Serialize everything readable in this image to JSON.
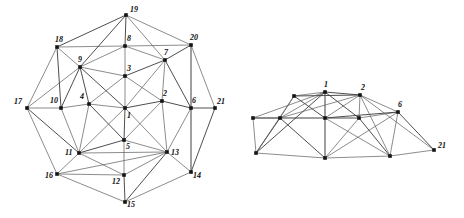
{
  "figure": {
    "type": "graph-diagram",
    "panels": [
      {
        "id": "left",
        "name": "star-embedding",
        "vertex_count": 21,
        "vertices": [
          {
            "id": "1",
            "x": 125,
            "y": 108,
            "label_dx": 2,
            "label_dy": 4
          },
          {
            "id": "2",
            "x": 162,
            "y": 101,
            "label_dx": 1,
            "label_dy": -11
          },
          {
            "id": "3",
            "x": 125,
            "y": 76,
            "label_dx": 2,
            "label_dy": -11
          },
          {
            "id": "4",
            "x": 89,
            "y": 104,
            "label_dx": -9,
            "label_dy": -11
          },
          {
            "id": "5",
            "x": 124,
            "y": 140,
            "label_dx": 2,
            "label_dy": 3
          },
          {
            "id": "6",
            "x": 191,
            "y": 108,
            "label_dx": 1,
            "label_dy": -11
          },
          {
            "id": "7",
            "x": 165,
            "y": 60,
            "label_dx": -1,
            "label_dy": -11
          },
          {
            "id": "8",
            "x": 125,
            "y": 46,
            "label_dx": 2,
            "label_dy": -11
          },
          {
            "id": "9",
            "x": 80,
            "y": 67,
            "label_dx": -2,
            "label_dy": -11
          },
          {
            "id": "10",
            "x": 61,
            "y": 108,
            "label_dx": -11,
            "label_dy": -11
          },
          {
            "id": "11",
            "x": 79,
            "y": 153,
            "label_dx": -14,
            "label_dy": -4
          },
          {
            "id": "12",
            "x": 124,
            "y": 175,
            "label_dx": -12,
            "label_dy": 3
          },
          {
            "id": "13",
            "x": 167,
            "y": 152,
            "label_dx": 4,
            "label_dy": -3
          },
          {
            "id": "14",
            "x": 191,
            "y": 172,
            "label_dx": 2,
            "label_dy": 0
          },
          {
            "id": "15",
            "x": 125,
            "y": 202,
            "label_dx": 2,
            "label_dy": -1
          },
          {
            "id": "16",
            "x": 57,
            "y": 174,
            "label_dx": -12,
            "label_dy": -2
          },
          {
            "id": "17",
            "x": 27,
            "y": 108,
            "label_dx": -13,
            "label_dy": -10
          },
          {
            "id": "18",
            "x": 57,
            "y": 47,
            "label_dx": -2,
            "label_dy": -11
          },
          {
            "id": "19",
            "x": 126,
            "y": 15,
            "label_dx": 4,
            "label_dy": -9
          },
          {
            "id": "20",
            "x": 191,
            "y": 45,
            "label_dx": -1,
            "label_dy": -11
          },
          {
            "id": "21",
            "x": 215,
            "y": 108,
            "label_dx": 2,
            "label_dy": -10
          }
        ],
        "edges": [
          [
            "1",
            "2"
          ],
          [
            "1",
            "3"
          ],
          [
            "1",
            "4"
          ],
          [
            "1",
            "5"
          ],
          [
            "2",
            "3"
          ],
          [
            "3",
            "4"
          ],
          [
            "4",
            "5"
          ],
          [
            "5",
            "2"
          ],
          [
            "1",
            "7"
          ],
          [
            "1",
            "9"
          ],
          [
            "1",
            "11"
          ],
          [
            "1",
            "13"
          ],
          [
            "2",
            "6"
          ],
          [
            "2",
            "7"
          ],
          [
            "2",
            "13"
          ],
          [
            "3",
            "7"
          ],
          [
            "3",
            "8"
          ],
          [
            "3",
            "9"
          ],
          [
            "4",
            "9"
          ],
          [
            "4",
            "10"
          ],
          [
            "4",
            "11"
          ],
          [
            "5",
            "11"
          ],
          [
            "5",
            "12"
          ],
          [
            "5",
            "13"
          ],
          [
            "6",
            "7"
          ],
          [
            "6",
            "13"
          ],
          [
            "6",
            "14"
          ],
          [
            "6",
            "21"
          ],
          [
            "6",
            "20"
          ],
          [
            "7",
            "8"
          ],
          [
            "7",
            "20"
          ],
          [
            "7",
            "19"
          ],
          [
            "8",
            "9"
          ],
          [
            "8",
            "19"
          ],
          [
            "8",
            "18"
          ],
          [
            "8",
            "20"
          ],
          [
            "9",
            "10"
          ],
          [
            "9",
            "18"
          ],
          [
            "9",
            "17"
          ],
          [
            "9",
            "19"
          ],
          [
            "10",
            "11"
          ],
          [
            "10",
            "17"
          ],
          [
            "10",
            "18"
          ],
          [
            "11",
            "12"
          ],
          [
            "11",
            "16"
          ],
          [
            "11",
            "17"
          ],
          [
            "11",
            "13"
          ],
          [
            "12",
            "13"
          ],
          [
            "12",
            "15"
          ],
          [
            "12",
            "16"
          ],
          [
            "13",
            "14"
          ],
          [
            "13",
            "15"
          ],
          [
            "13",
            "16"
          ],
          [
            "14",
            "15"
          ],
          [
            "14",
            "21"
          ],
          [
            "16",
            "15"
          ],
          [
            "16",
            "17"
          ],
          [
            "18",
            "19"
          ],
          [
            "19",
            "20"
          ],
          [
            "20",
            "21"
          ],
          [
            "17",
            "16"
          ],
          [
            "18",
            "17"
          ],
          [
            "20",
            "14"
          ],
          [
            "18",
            "10"
          ]
        ]
      },
      {
        "id": "right",
        "name": "compressed-arc-embedding",
        "vertex_count": 21,
        "vertices": [
          {
            "id": "r1",
            "x": 325,
            "y": 92,
            "label": "1",
            "label_dx": -1,
            "label_dy": -11
          },
          {
            "id": "r2",
            "x": 360,
            "y": 95,
            "label": "2",
            "label_dx": 1,
            "label_dy": -11
          },
          {
            "id": "r3",
            "x": 325,
            "y": 118,
            "label": "",
            "label_dx": 0,
            "label_dy": 0
          },
          {
            "id": "r4",
            "x": 294,
            "y": 96,
            "label": "",
            "label_dx": 0,
            "label_dy": 0
          },
          {
            "id": "r5",
            "x": 325,
            "y": 158,
            "label": "",
            "label_dx": 0,
            "label_dy": 0
          },
          {
            "id": "r6",
            "x": 398,
            "y": 112,
            "label": "6",
            "label_dx": 0,
            "label_dy": -11
          },
          {
            "id": "r7",
            "x": 359,
            "y": 118,
            "label": "",
            "label_dx": 0,
            "label_dy": 0
          },
          {
            "id": "r8",
            "x": 325,
            "y": 92,
            "label": "",
            "label_dx": 0,
            "label_dy": 0
          },
          {
            "id": "r9",
            "x": 280,
            "y": 118,
            "label": "",
            "label_dx": 0,
            "label_dy": 0
          },
          {
            "id": "r10",
            "x": 253,
            "y": 118,
            "label": "",
            "label_dx": 0,
            "label_dy": 0
          },
          {
            "id": "r11",
            "x": 256,
            "y": 153,
            "label": "",
            "label_dx": 0,
            "label_dy": 0
          },
          {
            "id": "r12",
            "x": 325,
            "y": 158,
            "label": "",
            "label_dx": 0,
            "label_dy": 0
          },
          {
            "id": "r13",
            "x": 390,
            "y": 156,
            "label": "",
            "label_dx": 0,
            "label_dy": 0
          },
          {
            "id": "r21",
            "x": 434,
            "y": 150,
            "label": "21",
            "label_dx": 4,
            "label_dy": -8
          }
        ],
        "edges": [
          [
            "r10",
            "r9"
          ],
          [
            "r9",
            "r4"
          ],
          [
            "r4",
            "r1"
          ],
          [
            "r1",
            "r2"
          ],
          [
            "r2",
            "r6"
          ],
          [
            "r10",
            "r11"
          ],
          [
            "r11",
            "r9"
          ],
          [
            "r11",
            "r4"
          ],
          [
            "r9",
            "r3"
          ],
          [
            "r4",
            "r3"
          ],
          [
            "r10",
            "r3"
          ],
          [
            "r9",
            "r1"
          ],
          [
            "r4",
            "r2"
          ],
          [
            "r3",
            "r1"
          ],
          [
            "r3",
            "r2"
          ],
          [
            "r3",
            "r7"
          ],
          [
            "r7",
            "r2"
          ],
          [
            "r7",
            "r6"
          ],
          [
            "r3",
            "r6"
          ],
          [
            "r11",
            "r5"
          ],
          [
            "r5",
            "r3"
          ],
          [
            "r5",
            "r9"
          ],
          [
            "r5",
            "r7"
          ],
          [
            "r5",
            "r13"
          ],
          [
            "r13",
            "r7"
          ],
          [
            "r13",
            "r6"
          ],
          [
            "r13",
            "r21"
          ],
          [
            "r6",
            "r21"
          ],
          [
            "r2",
            "r21"
          ],
          [
            "r11",
            "r10"
          ],
          [
            "r5",
            "r11"
          ],
          [
            "r13",
            "r3"
          ],
          [
            "r10",
            "r1"
          ],
          [
            "r11",
            "r1"
          ],
          [
            "r13",
            "r2"
          ],
          [
            "r5",
            "r1"
          ],
          [
            "r7",
            "r1"
          ],
          [
            "r9",
            "r2"
          ],
          [
            "r6",
            "r5"
          ]
        ]
      }
    ]
  }
}
